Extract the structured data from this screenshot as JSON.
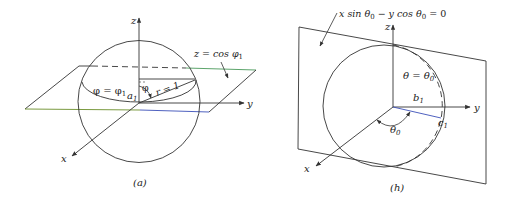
{
  "figure_a": {
    "caption": "(a)",
    "axis_labels": {
      "x": "x",
      "y": "y",
      "z": "z"
    },
    "plane_label": "z = cos φ",
    "plane_label_sub": "1",
    "circle_label": "φ = φ",
    "circle_label_sub": "1",
    "point_label": "a",
    "point_label_sub": "1",
    "angle_label": "φ",
    "radius_label": "r = 1"
  },
  "figure_b": {
    "caption": "(h)",
    "axis_labels": {
      "x": "x",
      "y": "y",
      "z": "z"
    },
    "plane_label_parts": [
      "x sin θ",
      "0",
      " − y cos θ",
      "0",
      " = 0"
    ],
    "meridian_label": "θ = θ",
    "meridian_label_sub": "0",
    "b_label": "b",
    "b_label_sub": "1",
    "c_label": "c",
    "c_label_sub": "1",
    "angle_label": "θ",
    "angle_label_sub": "0"
  },
  "colors": {
    "ink": "#333333",
    "plane_front_edge": "#6b8f2a",
    "plane_front_edge_right": "#3b4fb8",
    "plane_back_edge": "#4a9a5a"
  }
}
